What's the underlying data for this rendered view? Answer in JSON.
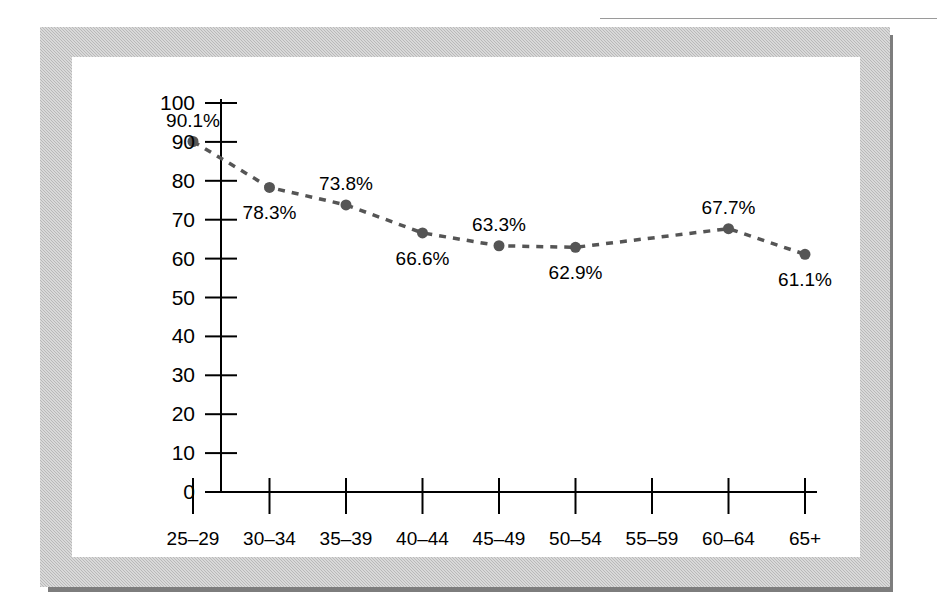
{
  "figure": {
    "frame_color": "#b9b9b9",
    "shadow_color": "#7d7d7d",
    "card_color": "#ffffff"
  },
  "chart_data": {
    "type": "line",
    "title": "",
    "subtitle": "",
    "xlabel": "",
    "ylabel": "",
    "grid": false,
    "legend": null,
    "line_style": "dashed",
    "line_color": "#555555",
    "marker_color": "#555555",
    "axis_color": "#000000",
    "ylim": [
      0,
      100
    ],
    "yticks": [
      0,
      10,
      20,
      30,
      40,
      50,
      60,
      70,
      80,
      90,
      100
    ],
    "ytick_labels": [
      "0",
      "10",
      "20",
      "30",
      "40",
      "50",
      "60",
      "70",
      "80",
      "90",
      "100"
    ],
    "categories": [
      "25–29",
      "30–34",
      "35–39",
      "40–44",
      "45–49",
      "50–54",
      "55–59",
      "60–64",
      "65+"
    ],
    "values": [
      90.1,
      78.3,
      73.8,
      66.6,
      63.3,
      62.9,
      null,
      67.7,
      61.1
    ],
    "point_labels": [
      "90.1%",
      "78.3%",
      "73.8%",
      "66.6%",
      "63.3%",
      "62.9%",
      "",
      "67.7%",
      "61.1%"
    ],
    "label_positions": [
      "above",
      "below",
      "above",
      "below",
      "above",
      "below",
      "",
      "above",
      "below"
    ],
    "markers_shown": [
      true,
      true,
      true,
      true,
      true,
      true,
      false,
      true,
      true
    ]
  }
}
